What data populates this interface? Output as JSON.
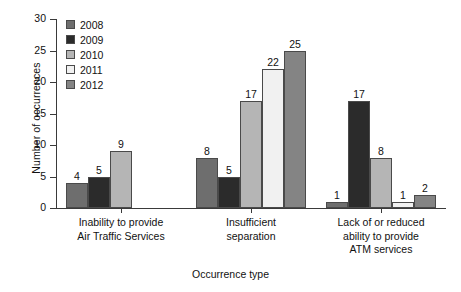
{
  "chart_data": {
    "type": "bar",
    "title": "",
    "xlabel": "Occurrence type",
    "ylabel": "Number of occurrences",
    "ylim": [
      0,
      30
    ],
    "yticks": [
      0,
      5,
      10,
      15,
      20,
      25,
      30
    ],
    "ytick_labels": [
      "0",
      "5",
      "10",
      "15",
      "20",
      "25",
      "30"
    ],
    "grid": false,
    "legend_position": "top-left inside",
    "categories": [
      "Inability to provide\nAir Traffic Services",
      "Insufficient\nseparation",
      "Lack of or reduced\nability to provide\nATM services"
    ],
    "series": [
      {
        "name": "2008",
        "color": "#6e6e6e",
        "values": [
          4,
          8,
          1
        ]
      },
      {
        "name": "2009",
        "color": "#2b2b2b",
        "values": [
          5,
          5,
          17
        ]
      },
      {
        "name": "2010",
        "color": "#b5b5b5",
        "values": [
          9,
          17,
          8
        ]
      },
      {
        "name": "2011",
        "color": "#f1f1f1",
        "values": [
          null,
          22,
          1
        ]
      },
      {
        "name": "2012",
        "color": "#848484",
        "values": [
          null,
          25,
          2
        ]
      }
    ],
    "bar_labels": [
      [
        "4",
        "5",
        "9",
        "",
        ""
      ],
      [
        "8",
        "5",
        "17",
        "22",
        "25"
      ],
      [
        "1",
        "17",
        "8",
        "1",
        "2"
      ]
    ]
  },
  "legend": {
    "items": [
      {
        "label": "2008",
        "color": "#6e6e6e"
      },
      {
        "label": "2009",
        "color": "#2b2b2b"
      },
      {
        "label": "2010",
        "color": "#b5b5b5"
      },
      {
        "label": "2011",
        "color": "#f1f1f1"
      },
      {
        "label": "2012",
        "color": "#848484"
      }
    ]
  },
  "axes": {
    "y_title": "Number of occurrences",
    "x_title": "Occurrence type"
  }
}
